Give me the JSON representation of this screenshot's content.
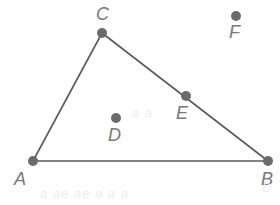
{
  "figure": {
    "width": 280,
    "height": 205,
    "background_color": "#ffffff",
    "stroke_color": "#5a5a5a",
    "dot_color": "#6b6b6b",
    "label_color": "#787878",
    "dot_radius": 5,
    "line_width": 1.6,
    "points": [
      {
        "name": "A",
        "label": "A",
        "x": 33,
        "y": 161,
        "label_x": 14,
        "label_y": 170,
        "on_figure": "vertex",
        "has_dot": true
      },
      {
        "name": "B",
        "label": "B",
        "x": 268,
        "y": 161,
        "label_x": 261,
        "label_y": 170,
        "on_figure": "vertex",
        "has_dot": true
      },
      {
        "name": "C",
        "label": "C",
        "x": 102,
        "y": 33,
        "label_x": 96,
        "label_y": 5,
        "on_figure": "vertex",
        "has_dot": true
      },
      {
        "name": "D",
        "label": "D",
        "x": 116,
        "y": 118,
        "label_x": 108,
        "label_y": 126,
        "on_figure": "interior",
        "has_dot": true
      },
      {
        "name": "E",
        "label": "E",
        "x": 186,
        "y": 96,
        "label_x": 176,
        "label_y": 104,
        "on_figure": "on-segment-CB",
        "has_dot": true
      },
      {
        "name": "F",
        "label": "F",
        "x": 236,
        "y": 16,
        "label_x": 229,
        "label_y": 23,
        "on_figure": "exterior",
        "has_dot": true
      }
    ],
    "segments": [
      {
        "name": "segment-AB",
        "from": "A",
        "to": "B"
      },
      {
        "name": "segment-AC",
        "from": "A",
        "to": "C"
      },
      {
        "name": "segment-CB",
        "from": "C",
        "to": "B"
      }
    ],
    "artifacts": [
      {
        "name": "ghost-bottom-1",
        "text": "a  ae  ae a  a  a",
        "x": 40,
        "y": 187
      },
      {
        "name": "ghost-bottom-2",
        "text": "D",
        "x": 262,
        "y": 181
      },
      {
        "name": "ghost-middle",
        "text": "a a",
        "x": 132,
        "y": 106
      }
    ]
  }
}
